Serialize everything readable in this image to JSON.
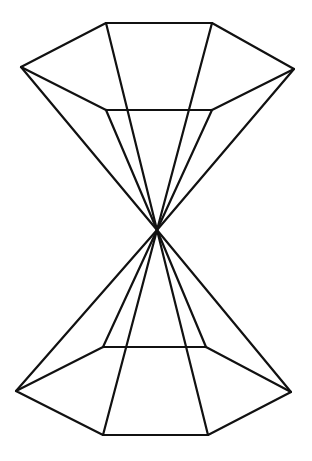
{
  "figure": {
    "line_color": "#111111",
    "background": "#ffffff",
    "parts": [
      "upper-hexagonal-pyramid",
      "lower-hexagonal-pyramid",
      "shared-apex"
    ]
  }
}
